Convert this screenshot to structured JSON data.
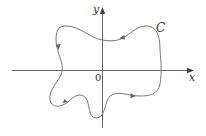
{
  "diagram": {
    "type": "closed-curve-on-axes",
    "axes": {
      "x_label": "x",
      "y_label": "y",
      "origin_label": "0"
    },
    "curve": {
      "label": "C",
      "orientation": "counterclockwise",
      "arrow_count": 4
    },
    "colors": {
      "axis": "#555555",
      "curve": "#777777",
      "text": "#333333"
    }
  }
}
